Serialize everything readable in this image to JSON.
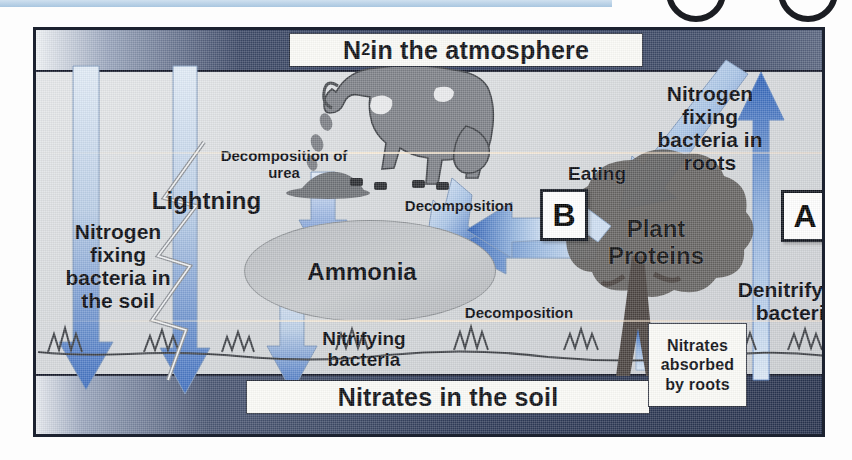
{
  "diagram": {
    "title_top": "N2 in the atmosphere",
    "title_top_main": "N",
    "title_top_sub": "2",
    "title_top_rest": " in the atmosphere",
    "title_bottom": "Nitrates in the soil",
    "labels": {
      "lightning": "Lightning",
      "nfix_soil": "Nitrogen fixing bacteria in the soil",
      "nfix_roots": "Nitrogen fixing bacteria in roots",
      "denitrifying": "Denitrifying bacteria",
      "decomposition_of_urea": "Decomposition of urea",
      "decomposition_1": "Decomposition",
      "decomposition_2": "Decomposition",
      "eating": "Eating",
      "nitrifying": "Nitrifying bacteria",
      "ammonia": "Ammonia",
      "plant_proteins": "Plant Proteins",
      "nitrates_absorbed": "Nitrates absorbed by roots"
    },
    "keys": {
      "a": "A",
      "b": "B"
    },
    "colors": {
      "band_dark": "#2f3b58",
      "arrow_blue": "#3a6fc4",
      "arrow_light": "#cbdcef",
      "ink": "#0b0d12",
      "paper": "#d6d9dc",
      "animal_grey": "#7e8187",
      "tree_grey": "#5c5a58",
      "top_strip": "#a9c6e0"
    }
  }
}
